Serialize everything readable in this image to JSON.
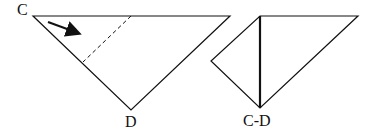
{
  "diagram": {
    "left_figure": {
      "label_top_left": "C",
      "label_bottom": "D",
      "fold_line": "dashed",
      "arrow": "fold direction C toward D"
    },
    "right_figure": {
      "label_bottom": "C-D"
    },
    "colors": {
      "stroke": "#111111",
      "background": "#ffffff"
    }
  }
}
